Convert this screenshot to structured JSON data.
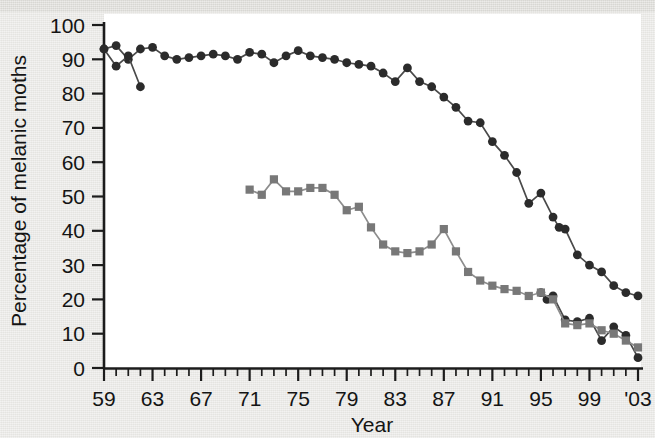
{
  "figure": {
    "background_color": "#e9e8e5",
    "plot_background_color": "#ffffff",
    "axis_color": "#1c1c1c"
  },
  "axes": {
    "y_title": "Percentage of melanic moths",
    "x_title": "Year",
    "y_ticks": [
      "0",
      "10",
      "20",
      "30",
      "40",
      "50",
      "60",
      "70",
      "80",
      "90",
      "100"
    ],
    "x_ticks": [
      "59",
      "63",
      "67",
      "71",
      "75",
      "79",
      "83",
      "87",
      "91",
      "95",
      "99",
      "'03"
    ]
  },
  "chart_data": {
    "type": "line",
    "title": "",
    "xlabel": "Year",
    "ylabel": "Percentage of melanic moths",
    "xlim": [
      59,
      103
    ],
    "ylim": [
      0,
      100
    ],
    "grid": false,
    "legend": "none",
    "x_tick_values": [
      59,
      63,
      67,
      71,
      75,
      79,
      83,
      87,
      91,
      95,
      99,
      103
    ],
    "x_tick_labels": [
      "59",
      "63",
      "67",
      "71",
      "75",
      "79",
      "83",
      "87",
      "91",
      "95",
      "99",
      "'03"
    ],
    "y_tick_values": [
      0,
      10,
      20,
      30,
      40,
      50,
      60,
      70,
      80,
      90,
      100
    ],
    "series": [
      {
        "name": "dark-circle-series",
        "marker": "circle",
        "color": "#2b2b2b",
        "line_color": "#4a4a4a",
        "x": [
          59,
          60,
          61,
          62,
          63,
          64,
          65,
          66,
          67,
          68,
          69,
          70,
          71,
          72,
          73,
          74,
          75,
          76,
          77,
          78,
          79,
          80,
          81,
          82,
          83,
          84,
          85,
          86,
          87,
          88,
          89,
          90,
          91,
          92,
          93,
          94,
          95,
          96,
          96.5,
          97,
          98,
          99,
          100,
          101,
          102,
          103
        ],
        "y": [
          93,
          94,
          90,
          93,
          93.5,
          91,
          90,
          90.5,
          91,
          91.5,
          91,
          90,
          92,
          91.5,
          89,
          91,
          92.5,
          91,
          90.5,
          90,
          89,
          88.5,
          88,
          86,
          83.5,
          87.5,
          83.5,
          82,
          79,
          76,
          72,
          71.5,
          66,
          62,
          57,
          48,
          51,
          44,
          41,
          40.5,
          33,
          30,
          28,
          24,
          22,
          21
        ]
      },
      {
        "name": "dark-circle-series-tail",
        "marker": "circle",
        "color": "#2b2b2b",
        "line_color": "#4a4a4a",
        "x": [
          95,
          95.5,
          96,
          97,
          98,
          99,
          100,
          101,
          102,
          103
        ],
        "y": [
          22,
          20,
          21,
          14,
          13.5,
          14.5,
          8,
          12,
          9.5,
          3
        ]
      },
      {
        "name": "dark-secondary-early-branch",
        "marker": "circle",
        "color": "#2b2b2b",
        "line_color": "#4a4a4a",
        "x": [
          59,
          60,
          61,
          62
        ],
        "y": [
          93,
          88,
          91,
          82
        ]
      },
      {
        "name": "grey-square-series",
        "marker": "square",
        "color": "#787878",
        "line_color": "#8d8d8d",
        "x": [
          71,
          72,
          73,
          74,
          75,
          76,
          77,
          78,
          79,
          80,
          81,
          82,
          83,
          84,
          85,
          86,
          87,
          88,
          89,
          90,
          91,
          92,
          93,
          94,
          95,
          96,
          97,
          98,
          99,
          100,
          101,
          102,
          103
        ],
        "y": [
          52,
          50.5,
          55,
          51.5,
          51.5,
          52.5,
          52.5,
          50.5,
          46,
          47,
          41,
          36,
          34,
          33.5,
          34,
          36,
          40.5,
          34,
          28,
          25.5,
          24,
          23,
          22.5,
          21,
          22,
          20,
          13,
          12.5,
          13,
          11,
          10,
          8,
          6
        ]
      }
    ]
  }
}
